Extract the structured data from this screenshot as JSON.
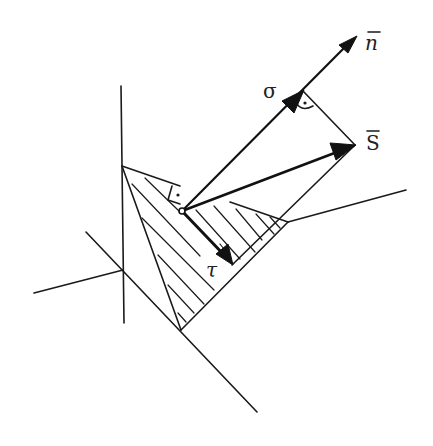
{
  "diagram": {
    "labels": {
      "normal": "n",
      "stress_vector": "S",
      "normal_stress": "σ",
      "shear_stress": "τ"
    },
    "label_overbar": "‾",
    "colors": {
      "ink": "#1a1a1a",
      "background": "#ffffff"
    },
    "elements": [
      "coordinate-axes",
      "inclined-plane-triangle",
      "hatched-cut-surface",
      "normal-vector-n",
      "stress-vector-S",
      "normal-component-sigma",
      "shear-component-tau",
      "right-angle-markers"
    ]
  }
}
